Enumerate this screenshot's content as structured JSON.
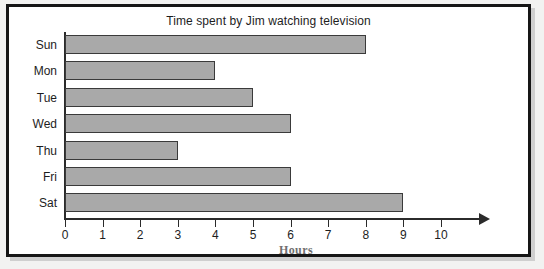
{
  "chart_data": {
    "type": "bar",
    "orientation": "horizontal",
    "title": "Time spent by Jim watching television",
    "xlabel": "Hours",
    "ylabel": "",
    "categories": [
      "Sun",
      "Mon",
      "Tue",
      "Wed",
      "Thu",
      "Fri",
      "Sat"
    ],
    "values": [
      8,
      4,
      5,
      6,
      3,
      6,
      9
    ],
    "xticks": [
      "0",
      "1",
      "2",
      "3",
      "4",
      "5",
      "6",
      "7",
      "8",
      "9",
      "10"
    ],
    "xlim": [
      0,
      10
    ],
    "grid": false,
    "legend": false,
    "bar_color": "#a9a9a9",
    "bar_border_color": "#3a3a3a",
    "axis_color": "#2b2b2b",
    "text_color": "#1d1d1d",
    "caption_color": "#6f6f6f"
  },
  "frame": {
    "border_color": "#161616",
    "background": "#ffffff"
  }
}
